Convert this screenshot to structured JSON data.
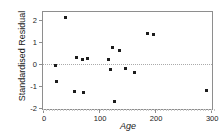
{
  "chart_data": {
    "type": "scatter",
    "title": "",
    "xlabel": "Age",
    "ylabel": "Standardised Residual",
    "xlim": [
      0,
      305
    ],
    "ylim": [
      -2.15,
      2.35
    ],
    "xticks": [
      0,
      100,
      200,
      300
    ],
    "yticks": [
      2,
      1,
      0,
      -1,
      -2
    ],
    "xticklabels": [
      "0",
      "100",
      "200",
      "300"
    ],
    "yticklabels": [
      "2",
      "1",
      "0",
      "-1",
      "-2"
    ],
    "grid": false,
    "legend": null,
    "reference_lines": [
      {
        "orientation": "horizontal",
        "value": 0,
        "style": "dotted",
        "color": "#aaaaaa"
      }
    ],
    "marker": {
      "shape": "square",
      "size": 3,
      "color": "#1c1c1c"
    },
    "points": [
      {
        "x": 22,
        "y": -0.08
      },
      {
        "x": 24,
        "y": -0.8
      },
      {
        "x": 41,
        "y": 2.11
      },
      {
        "x": 57,
        "y": -1.25
      },
      {
        "x": 59,
        "y": 0.27
      },
      {
        "x": 70,
        "y": 0.2
      },
      {
        "x": 73,
        "y": -1.32
      },
      {
        "x": 79,
        "y": 0.25
      },
      {
        "x": 116,
        "y": 0.18
      },
      {
        "x": 121,
        "y": -0.27
      },
      {
        "x": 124,
        "y": 0.73
      },
      {
        "x": 127,
        "y": -1.74
      },
      {
        "x": 137,
        "y": 0.58
      },
      {
        "x": 147,
        "y": -0.22
      },
      {
        "x": 164,
        "y": -0.38
      },
      {
        "x": 186,
        "y": 1.37
      },
      {
        "x": 197,
        "y": 1.32
      },
      {
        "x": 292,
        "y": -1.24
      }
    ]
  },
  "axis_colors": {
    "frame": "#8e8e8e",
    "text": "#1a1a1a",
    "reference": "#aaaaaa"
  }
}
